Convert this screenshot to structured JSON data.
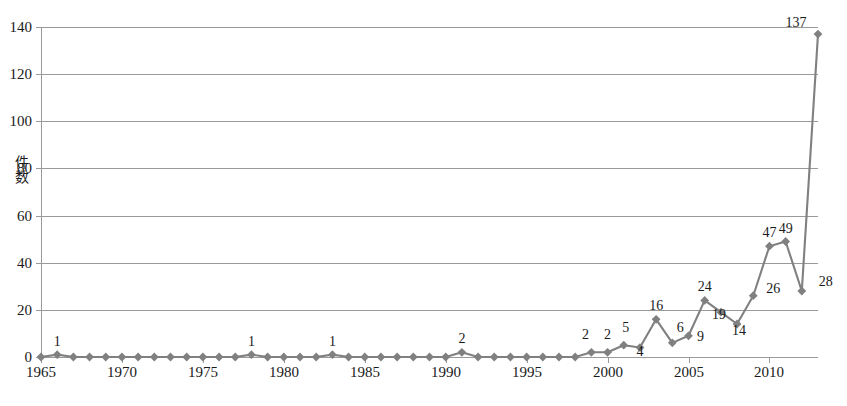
{
  "chart": {
    "title": "",
    "y_axis_title": "件数",
    "y_ticks": [
      "0",
      "20",
      "40",
      "60",
      "80",
      "100",
      "120",
      "140"
    ],
    "x_ticks": [
      "1965",
      "1970",
      "1975",
      "1980",
      "1985",
      "1990",
      "1995",
      "2000",
      "2005",
      "2010"
    ],
    "series_color": "#808080",
    "grid_color": "#9a9a9a"
  },
  "chart_data": {
    "type": "line",
    "title": "",
    "xlabel": "",
    "ylabel": "件数",
    "xlim": [
      1965,
      1913
    ],
    "ylim": [
      0,
      140
    ],
    "ytick_step": 20,
    "grid": true,
    "legend": "none",
    "marker": "diamond",
    "x": [
      1965,
      1966,
      1967,
      1968,
      1969,
      1970,
      1971,
      1972,
      1973,
      1974,
      1975,
      1976,
      1977,
      1978,
      1979,
      1980,
      1981,
      1982,
      1983,
      1984,
      1985,
      1986,
      1987,
      1988,
      1989,
      1990,
      1991,
      1992,
      1993,
      1994,
      1995,
      1996,
      1997,
      1998,
      1999,
      2000,
      2001,
      2002,
      2003,
      2004,
      2005,
      2006,
      2007,
      2008,
      2009,
      2010,
      2011,
      2012,
      2013
    ],
    "values": [
      0,
      1,
      0,
      0,
      0,
      0,
      0,
      0,
      0,
      0,
      0,
      0,
      0,
      1,
      0,
      0,
      0,
      0,
      1,
      0,
      0,
      0,
      0,
      0,
      0,
      0,
      2,
      0,
      0,
      0,
      0,
      0,
      0,
      0,
      2,
      2,
      5,
      4,
      16,
      6,
      9,
      24,
      19,
      14,
      26,
      47,
      49,
      28,
      137
    ],
    "point_labels": [
      {
        "x": 1966,
        "y": 1,
        "text": "1"
      },
      {
        "x": 1978,
        "y": 1,
        "text": "1"
      },
      {
        "x": 1983,
        "y": 1,
        "text": "1"
      },
      {
        "x": 1991,
        "y": 2,
        "text": "2"
      },
      {
        "x": 1999,
        "y": 2,
        "text": "2"
      },
      {
        "x": 2000,
        "y": 2,
        "text": "2"
      },
      {
        "x": 2001,
        "y": 5,
        "text": "5"
      },
      {
        "x": 2002,
        "y": 4,
        "text": "4"
      },
      {
        "x": 2003,
        "y": 16,
        "text": "16"
      },
      {
        "x": 2004,
        "y": 6,
        "text": "6"
      },
      {
        "x": 2005,
        "y": 9,
        "text": "9"
      },
      {
        "x": 2006,
        "y": 24,
        "text": "24"
      },
      {
        "x": 2007,
        "y": 19,
        "text": "19"
      },
      {
        "x": 2008,
        "y": 14,
        "text": "14"
      },
      {
        "x": 2009,
        "y": 26,
        "text": "26"
      },
      {
        "x": 2010,
        "y": 47,
        "text": "47"
      },
      {
        "x": 2011,
        "y": 49,
        "text": "49"
      },
      {
        "x": 2012,
        "y": 28,
        "text": "28"
      },
      {
        "x": 2013,
        "y": 137,
        "text": "137"
      }
    ]
  }
}
